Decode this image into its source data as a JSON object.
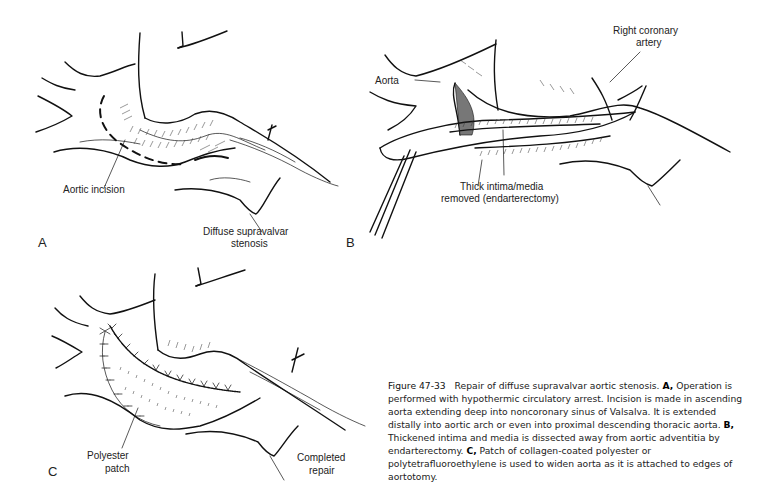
{
  "figure": {
    "number": "Figure 47-33",
    "title": "Repair of diffuse supravalvar aortic stenosis.",
    "caption_parts": [
      {
        "panel": "A,",
        "text": "Operation is performed with hypothermic circulatory arrest. Incision is made in ascending aorta extending deep into noncoronary sinus of Valsalva. It is extended distally into aortic arch or even into proximal descending thoracic aorta."
      },
      {
        "panel": "B,",
        "text": "Thickened intima and media is dissected away from aortic adventitia by endarterectomy."
      },
      {
        "panel": "C,",
        "text": "Patch of collagen-coated polyester or polytetrafluoroethylene is used to widen aorta as it is attached to edges of aortotomy."
      }
    ]
  },
  "panels": [
    {
      "letter": "A",
      "labels": {
        "incision": "Aortic incision",
        "stenosis_line1": "Diffuse supravalvar",
        "stenosis_line2": "stenosis"
      }
    },
    {
      "letter": "B",
      "labels": {
        "aorta": "Aorta",
        "coronary_line1": "Right coronary",
        "coronary_line2": "artery",
        "intima_line1": "Thick intima/media",
        "intima_line2": "removed (endarterectomy)"
      }
    },
    {
      "letter": "C",
      "labels": {
        "patch_line1": "Polyester",
        "patch_line2": "patch",
        "repair_line1": "Completed",
        "repair_line2": "repair"
      }
    }
  ]
}
